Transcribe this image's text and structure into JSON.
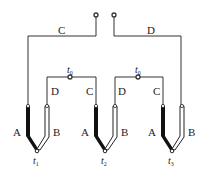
{
  "wire_labels": {
    "outer_left": "C",
    "outer_right": "D",
    "inner_1_left": "D",
    "inner_1_right": "C",
    "inner_2_left": "D",
    "inner_2_right": "C"
  },
  "thermocouples": [
    {
      "id": "tc1",
      "leg_a": "A",
      "leg_b": "B",
      "junction_label": "t",
      "junction_sub": "1"
    },
    {
      "id": "tc2",
      "leg_a": "A",
      "leg_b": "B",
      "junction_label": "t",
      "junction_sub": "2"
    },
    {
      "id": "tc3",
      "leg_a": "A",
      "leg_b": "B",
      "junction_label": "t",
      "junction_sub": "3"
    }
  ],
  "reference_junctions": [
    {
      "label": "t",
      "sub": "0"
    },
    {
      "label": "t",
      "sub": "0"
    }
  ],
  "colors": {
    "wire": "#555555",
    "leg_a": "#111111",
    "leg_b_fill": "#ffffff",
    "leg_b_stroke": "#222222"
  }
}
